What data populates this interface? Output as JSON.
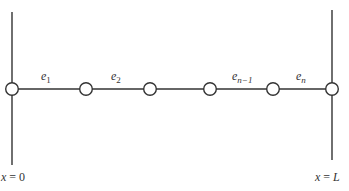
{
  "diagram": {
    "boundaries": {
      "left": {
        "label_var": "x",
        "label_eq": " = ",
        "label_val": "0"
      },
      "right": {
        "label_var": "x",
        "label_eq": " = ",
        "label_val": "L"
      }
    },
    "elements": [
      {
        "base": "e",
        "sub": "1"
      },
      {
        "base": "e",
        "sub": "2"
      },
      {
        "base": "e",
        "sub": "n−1"
      },
      {
        "base": "e",
        "sub": "n"
      }
    ],
    "node_count": 6,
    "colors": {
      "line": "#333333",
      "node_fill": "#ffffff",
      "text": "#333333"
    }
  }
}
